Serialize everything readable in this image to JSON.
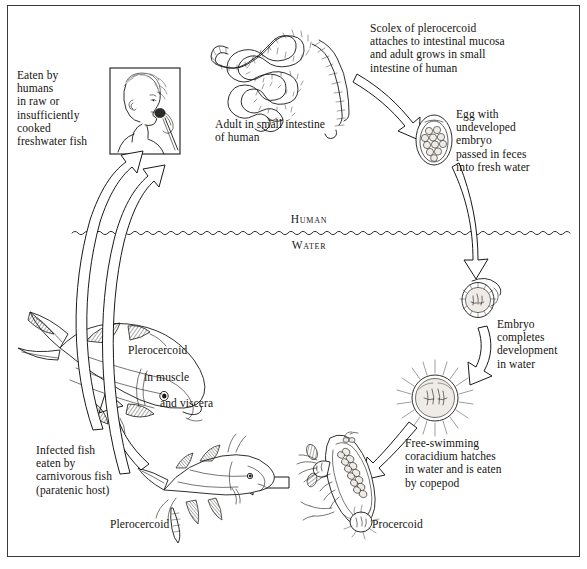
{
  "figure": {
    "border_color": "#3a3a3a",
    "ink_color": "#15130f",
    "background": "#ffffff"
  },
  "zones": {
    "above_label": "Human",
    "below_label": "Water"
  },
  "captions": {
    "eaten_by_humans": "Eaten by\nhumans\nin raw or\ninsufficiently\ncooked\nfreshwater fish",
    "adult_in_intestine": "Adult in small intestine\nof human",
    "scolex_attaches": "Scolex of plerocercoid\nattaches to intestinal mucosa\nand adult grows in small\nintestine of human",
    "egg_undeveloped": "Egg with\nundeveloped\nembryo\npassed in feces\ninto fresh water",
    "embryo_develops": "Embryo\ncompletes\ndevelopment\nin water",
    "coracidium_hatches": "Free-swimming\ncoracidium hatches\nin water and is eaten\nby copepod",
    "plerocercoid_in_fish_line1": "Plerocercoid",
    "plerocercoid_in_fish_line2": "in muscle",
    "plerocercoid_in_fish_line3": "and viscera",
    "infected_fish_eaten": "Infected fish\neaten by\ncarnivorous fish\n(paratenic host)",
    "plerocercoid_label": "Plerocercoid",
    "procercoid_label": "Procercoid"
  },
  "illustrations": {
    "human_eating_panel": "framed drawing of a person in profile eating fish from a fork",
    "adult_tapeworm": "long coiled segmented adult tapeworm strobila",
    "egg": "operculate oval egg containing a cluster of undeveloped embryonic cells",
    "coracidium_in_shell": "developed ciliated embryo inside the egg shell with lifted operculum",
    "free_coracidium": "free-swimming ciliated coracidium with radiating cilia",
    "copepod_with_procercoid": "copepod crustacean containing a procercoid larva",
    "small_fish_plerocercoid": "small fish harboring a plerocercoid larva",
    "large_carnivorous_fish": "large carnivorous fish (paratenic host)"
  },
  "arrows": [
    {
      "name": "adult-to-egg",
      "from": "adult tapeworm",
      "to": "egg"
    },
    {
      "name": "egg-to-embryo",
      "from": "egg",
      "to": "developing embryo in water"
    },
    {
      "name": "embryo-to-coracidium",
      "from": "developing embryo",
      "to": "free-swimming coracidium"
    },
    {
      "name": "coracidium-to-copepod",
      "from": "free-swimming coracidium",
      "to": "copepod"
    },
    {
      "name": "copepod-to-small-fish",
      "from": "copepod with procercoid",
      "to": "small fish"
    },
    {
      "name": "small-fish-to-large-fish",
      "from": "small fish plerocercoid",
      "to": "large carnivorous fish"
    },
    {
      "name": "fish-to-human",
      "from": "infected fish",
      "to": "human eating fish"
    }
  ]
}
